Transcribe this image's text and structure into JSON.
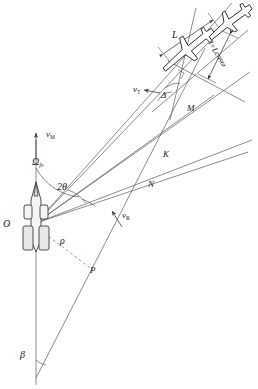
{
  "figure": {
    "type": "engagement-geometry-diagram",
    "stroke_color": "#4a4a4a",
    "label_color": "#1a1a1a",
    "background": "#ffffff"
  },
  "points": {
    "origin": {
      "id": "O",
      "label": "O",
      "x": 36,
      "y": 223,
      "role": "launch-platform"
    },
    "m": {
      "id": "M",
      "label": "M",
      "x": 190,
      "y": 110,
      "role": "target-point"
    },
    "k": {
      "id": "K",
      "label": "K",
      "x": 165,
      "y": 157,
      "role": "intersection-point"
    },
    "n": {
      "id": "N",
      "label": "N",
      "x": 150,
      "y": 185,
      "role": "intersection-point"
    },
    "p": {
      "id": "P",
      "label": "P",
      "x": 92,
      "y": 271,
      "role": "closest-approach-point"
    }
  },
  "vectors": {
    "missile_velocity": {
      "label": "v",
      "sub": "M",
      "x": 48,
      "y": 134
    },
    "target_velocity": {
      "label": "v",
      "sub": "T",
      "x": 135,
      "y": 90
    },
    "relative_velocity": {
      "label": "v",
      "sub": "R",
      "x": 124,
      "y": 216
    }
  },
  "angles": {
    "omega_f0": {
      "label": "Ω",
      "sub": "f",
      "sub2": "0",
      "x": 34,
      "y": 161
    },
    "two_theta": {
      "label": "2θ",
      "x": 60,
      "y": 186
    },
    "delta": {
      "label": "Δ",
      "x": 163,
      "y": 95
    },
    "beta": {
      "label": "β",
      "x": 22,
      "y": 355
    }
  },
  "dimensions": {
    "length_L": {
      "label": "L",
      "x": 174,
      "y": 36
    },
    "length_l": {
      "label": "l=Lcosω",
      "x": 226,
      "y": 58
    },
    "range_rho": {
      "label": "ρ",
      "x": 62,
      "y": 241
    }
  }
}
